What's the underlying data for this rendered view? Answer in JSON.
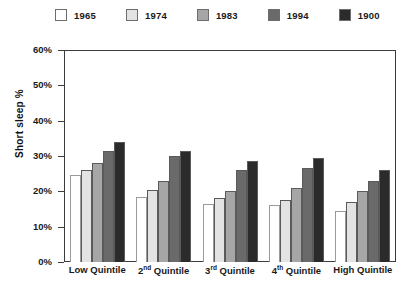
{
  "chart_data": {
    "type": "bar",
    "title": "",
    "xlabel": "",
    "ylabel": "Short sleep %",
    "ylim": [
      0,
      60
    ],
    "ytick_labels": [
      "60%",
      "50%",
      "40%",
      "30%",
      "20%",
      "10%",
      "0%"
    ],
    "ytick_values": [
      60,
      50,
      40,
      30,
      20,
      10,
      0
    ],
    "grid": false,
    "legend_position": "top",
    "categories": [
      "Low Quintile",
      "2nd Quintile",
      "3rd Quintile",
      "4th Quintile",
      "High Quintile"
    ],
    "category_labels": [
      {
        "text": "Low Quintile",
        "main": "Low",
        "sup": "",
        "rest": " Quintile"
      },
      {
        "text": "2nd Quintile",
        "main": "2",
        "sup": "nd",
        "rest": " Quintile"
      },
      {
        "text": "3rd Quintile",
        "main": "3",
        "sup": "rd",
        "rest": " Quintile"
      },
      {
        "text": "4th Quintile",
        "main": "4",
        "sup": "th",
        "rest": " Quintile"
      },
      {
        "text": "High Quintile",
        "main": "High",
        "sup": "",
        "rest": " Quintile"
      }
    ],
    "series": [
      {
        "name": "1965",
        "color": "#ffffff",
        "values": [
          24.5,
          18.5,
          16.5,
          16.0,
          14.5
        ]
      },
      {
        "name": "1974",
        "color": "#e3e3e3",
        "values": [
          26.0,
          20.5,
          18.0,
          17.5,
          17.0
        ]
      },
      {
        "name": "1983",
        "color": "#a6a6a6",
        "values": [
          28.0,
          23.0,
          20.0,
          21.0,
          20.0
        ]
      },
      {
        "name": "1994",
        "color": "#6a6a6a",
        "values": [
          31.5,
          30.0,
          26.0,
          26.5,
          23.0
        ]
      },
      {
        "name": "1900",
        "color": "#2b2b2b",
        "values": [
          34.0,
          31.5,
          28.5,
          29.5,
          26.0
        ]
      }
    ]
  },
  "legend": {
    "items": [
      {
        "label": "1965",
        "color": "#ffffff"
      },
      {
        "label": "1974",
        "color": "#e3e3e3"
      },
      {
        "label": "1983",
        "color": "#a6a6a6"
      },
      {
        "label": "1994",
        "color": "#6a6a6a"
      },
      {
        "label": "1900",
        "color": "#2b2b2b"
      }
    ]
  },
  "axis": {
    "y_title": "Short sleep %"
  }
}
